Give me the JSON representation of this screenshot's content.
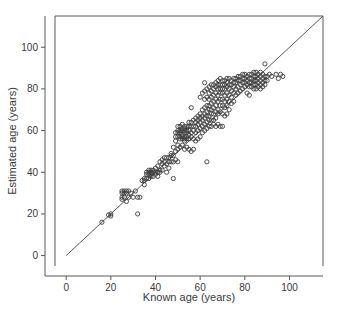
{
  "chart_data": {
    "type": "scatter",
    "title": "",
    "xlabel": "Known age (years)",
    "ylabel": "Estimated age (years)",
    "xlim": [
      -5,
      115
    ],
    "ylim": [
      -5,
      115
    ],
    "xticks": [
      0,
      20,
      40,
      60,
      80,
      100
    ],
    "yticks": [
      0,
      20,
      40,
      60,
      80,
      100
    ],
    "xtick_labels": [
      "0",
      "20",
      "40",
      "60",
      "80",
      "100"
    ],
    "ytick_labels": [
      "0",
      "20",
      "40",
      "60",
      "80",
      "100"
    ],
    "grid": false,
    "legend": null,
    "marker": "open-circle",
    "marker_color": "#3d3d3d",
    "frame_color": "#58585a",
    "reference_line": {
      "name": "identity-line",
      "type": "y=x",
      "from": [
        0,
        0
      ],
      "to": [
        115,
        115
      ],
      "color": "#4a4a4a"
    },
    "series": [
      {
        "name": "age-estimates",
        "points": [
          [
            16,
            16
          ],
          [
            19,
            19.5
          ],
          [
            20,
            20
          ],
          [
            20,
            19
          ],
          [
            25,
            30
          ],
          [
            25,
            31
          ],
          [
            25,
            27
          ],
          [
            25,
            28
          ],
          [
            26,
            30
          ],
          [
            26,
            31
          ],
          [
            26,
            28
          ],
          [
            27,
            31
          ],
          [
            27,
            30
          ],
          [
            27,
            26
          ],
          [
            28,
            31
          ],
          [
            28,
            28
          ],
          [
            29,
            30
          ],
          [
            30,
            28
          ],
          [
            31,
            31
          ],
          [
            32,
            20
          ],
          [
            32,
            28
          ],
          [
            33,
            28
          ],
          [
            34,
            36
          ],
          [
            35,
            34
          ],
          [
            35,
            37
          ],
          [
            35,
            36
          ],
          [
            36,
            39
          ],
          [
            36,
            37
          ],
          [
            36,
            40
          ],
          [
            37,
            41
          ],
          [
            37,
            39
          ],
          [
            37,
            40
          ],
          [
            37,
            37
          ],
          [
            38,
            41
          ],
          [
            38,
            40
          ],
          [
            38,
            39
          ],
          [
            38,
            38
          ],
          [
            39,
            41
          ],
          [
            39,
            40
          ],
          [
            39,
            38
          ],
          [
            40,
            42
          ],
          [
            40,
            40
          ],
          [
            40,
            39
          ],
          [
            41,
            43
          ],
          [
            41,
            40
          ],
          [
            41,
            38
          ],
          [
            42,
            45
          ],
          [
            42,
            41
          ],
          [
            42,
            40
          ],
          [
            43,
            46
          ],
          [
            43,
            44
          ],
          [
            43,
            41
          ],
          [
            44,
            47
          ],
          [
            44,
            45
          ],
          [
            44,
            43
          ],
          [
            45,
            47
          ],
          [
            45,
            44
          ],
          [
            45,
            40
          ],
          [
            46,
            47
          ],
          [
            46,
            45
          ],
          [
            46,
            42
          ],
          [
            47,
            49
          ],
          [
            47,
            48
          ],
          [
            47,
            45
          ],
          [
            48,
            52
          ],
          [
            48,
            48
          ],
          [
            48,
            45
          ],
          [
            48,
            37
          ],
          [
            49,
            59
          ],
          [
            49,
            57
          ],
          [
            49,
            55
          ],
          [
            49,
            50
          ],
          [
            49,
            46
          ],
          [
            50,
            62
          ],
          [
            50,
            60
          ],
          [
            50,
            59
          ],
          [
            50,
            57
          ],
          [
            50,
            53
          ],
          [
            50,
            51
          ],
          [
            50,
            45
          ],
          [
            51,
            62
          ],
          [
            51,
            60
          ],
          [
            51,
            59
          ],
          [
            51,
            57
          ],
          [
            51,
            56
          ],
          [
            51,
            52
          ],
          [
            52,
            63
          ],
          [
            52,
            61
          ],
          [
            52,
            60
          ],
          [
            52,
            58
          ],
          [
            52,
            57
          ],
          [
            52,
            56
          ],
          [
            52,
            53
          ],
          [
            53,
            62
          ],
          [
            53,
            61
          ],
          [
            53,
            60
          ],
          [
            53,
            59
          ],
          [
            53,
            57
          ],
          [
            53,
            56
          ],
          [
            53,
            55
          ],
          [
            53,
            51
          ],
          [
            54,
            62
          ],
          [
            54,
            60
          ],
          [
            54,
            59
          ],
          [
            54,
            57
          ],
          [
            54,
            56
          ],
          [
            54,
            52
          ],
          [
            55,
            64
          ],
          [
            55,
            62
          ],
          [
            55,
            60
          ],
          [
            55,
            58
          ],
          [
            55,
            56
          ],
          [
            55,
            51
          ],
          [
            56,
            71
          ],
          [
            56,
            64
          ],
          [
            56,
            62
          ],
          [
            56,
            59
          ],
          [
            56,
            57
          ],
          [
            56,
            50
          ],
          [
            57,
            65
          ],
          [
            57,
            62
          ],
          [
            57,
            60
          ],
          [
            57,
            56
          ],
          [
            57,
            51
          ],
          [
            58,
            66
          ],
          [
            58,
            64
          ],
          [
            58,
            62
          ],
          [
            58,
            59
          ],
          [
            58,
            55
          ],
          [
            59,
            67
          ],
          [
            59,
            65
          ],
          [
            59,
            63
          ],
          [
            59,
            60
          ],
          [
            59,
            56
          ],
          [
            60,
            76
          ],
          [
            60,
            68
          ],
          [
            60,
            66
          ],
          [
            60,
            64
          ],
          [
            60,
            61
          ],
          [
            60,
            57
          ],
          [
            61,
            78
          ],
          [
            61,
            70
          ],
          [
            61,
            67
          ],
          [
            61,
            65
          ],
          [
            61,
            62
          ],
          [
            61,
            59
          ],
          [
            62,
            83
          ],
          [
            62,
            79
          ],
          [
            62,
            75
          ],
          [
            62,
            71
          ],
          [
            62,
            68
          ],
          [
            62,
            66
          ],
          [
            62,
            63
          ],
          [
            62,
            60
          ],
          [
            63,
            80
          ],
          [
            63,
            76
          ],
          [
            63,
            72
          ],
          [
            63,
            69
          ],
          [
            63,
            67
          ],
          [
            63,
            64
          ],
          [
            63,
            61
          ],
          [
            63,
            45
          ],
          [
            64,
            81
          ],
          [
            64,
            78
          ],
          [
            64,
            75
          ],
          [
            64,
            72
          ],
          [
            64,
            70
          ],
          [
            64,
            67
          ],
          [
            64,
            65
          ],
          [
            64,
            62
          ],
          [
            65,
            82
          ],
          [
            65,
            79
          ],
          [
            65,
            76
          ],
          [
            65,
            73
          ],
          [
            65,
            70
          ],
          [
            65,
            68
          ],
          [
            65,
            65
          ],
          [
            65,
            62
          ],
          [
            66,
            82
          ],
          [
            66,
            80
          ],
          [
            66,
            77
          ],
          [
            66,
            74
          ],
          [
            66,
            71
          ],
          [
            66,
            68
          ],
          [
            66,
            65
          ],
          [
            66,
            63
          ],
          [
            67,
            83
          ],
          [
            67,
            81
          ],
          [
            67,
            78
          ],
          [
            67,
            75
          ],
          [
            67,
            72
          ],
          [
            67,
            69
          ],
          [
            67,
            66
          ],
          [
            67,
            62
          ],
          [
            68,
            84
          ],
          [
            68,
            82
          ],
          [
            68,
            80
          ],
          [
            68,
            77
          ],
          [
            68,
            74
          ],
          [
            68,
            70
          ],
          [
            68,
            68
          ],
          [
            68,
            63
          ],
          [
            69,
            85
          ],
          [
            69,
            82
          ],
          [
            69,
            80
          ],
          [
            69,
            78
          ],
          [
            69,
            75
          ],
          [
            69,
            72
          ],
          [
            69,
            69
          ],
          [
            69,
            62
          ],
          [
            70,
            84
          ],
          [
            70,
            82
          ],
          [
            70,
            80
          ],
          [
            70,
            78
          ],
          [
            70,
            75
          ],
          [
            70,
            72
          ],
          [
            70,
            68
          ],
          [
            70,
            62
          ],
          [
            71,
            84
          ],
          [
            71,
            82
          ],
          [
            71,
            80
          ],
          [
            71,
            77
          ],
          [
            71,
            74
          ],
          [
            71,
            71
          ],
          [
            71,
            67
          ],
          [
            72,
            85
          ],
          [
            72,
            83
          ],
          [
            72,
            81
          ],
          [
            72,
            78
          ],
          [
            72,
            75
          ],
          [
            72,
            72
          ],
          [
            72,
            68
          ],
          [
            73,
            85
          ],
          [
            73,
            82
          ],
          [
            73,
            80
          ],
          [
            73,
            77
          ],
          [
            73,
            74
          ],
          [
            73,
            70
          ],
          [
            74,
            84
          ],
          [
            74,
            82
          ],
          [
            74,
            79
          ],
          [
            74,
            76
          ],
          [
            74,
            73
          ],
          [
            75,
            85
          ],
          [
            75,
            83
          ],
          [
            75,
            81
          ],
          [
            75,
            78
          ],
          [
            75,
            74
          ],
          [
            76,
            85
          ],
          [
            76,
            83
          ],
          [
            76,
            80
          ],
          [
            76,
            77
          ],
          [
            77,
            86
          ],
          [
            77,
            84
          ],
          [
            77,
            81
          ],
          [
            77,
            78
          ],
          [
            78,
            86
          ],
          [
            78,
            84
          ],
          [
            78,
            82
          ],
          [
            78,
            79
          ],
          [
            79,
            87
          ],
          [
            79,
            85
          ],
          [
            79,
            83
          ],
          [
            79,
            80
          ],
          [
            80,
            87
          ],
          [
            80,
            85
          ],
          [
            80,
            83
          ],
          [
            80,
            81
          ],
          [
            81,
            86
          ],
          [
            81,
            84
          ],
          [
            81,
            82
          ],
          [
            81,
            78
          ],
          [
            82,
            87
          ],
          [
            82,
            85
          ],
          [
            82,
            83
          ],
          [
            82,
            81
          ],
          [
            82,
            77
          ],
          [
            83,
            87
          ],
          [
            83,
            85
          ],
          [
            83,
            83
          ],
          [
            83,
            81
          ],
          [
            84,
            88
          ],
          [
            84,
            86
          ],
          [
            84,
            84
          ],
          [
            84,
            82
          ],
          [
            84,
            80
          ],
          [
            85,
            88
          ],
          [
            85,
            86
          ],
          [
            85,
            84
          ],
          [
            85,
            82
          ],
          [
            85,
            80
          ],
          [
            86,
            87
          ],
          [
            86,
            85
          ],
          [
            86,
            83
          ],
          [
            86,
            81
          ],
          [
            87,
            88
          ],
          [
            87,
            86
          ],
          [
            87,
            84
          ],
          [
            87,
            82
          ],
          [
            87,
            80
          ],
          [
            88,
            87
          ],
          [
            88,
            85
          ],
          [
            88,
            83
          ],
          [
            88,
            81
          ],
          [
            89,
            92
          ],
          [
            89,
            86
          ],
          [
            89,
            84
          ],
          [
            89,
            82
          ],
          [
            90,
            86
          ],
          [
            90,
            84
          ],
          [
            91,
            87
          ],
          [
            92,
            86
          ],
          [
            94,
            87
          ],
          [
            95,
            85
          ],
          [
            96,
            87
          ],
          [
            97,
            86
          ]
        ]
      }
    ]
  }
}
